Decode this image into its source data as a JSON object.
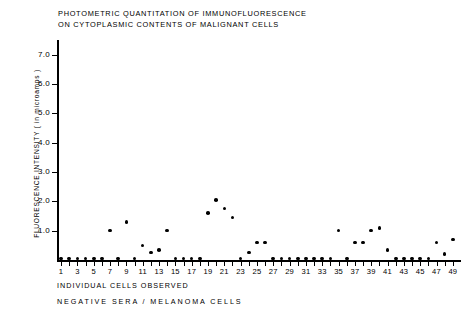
{
  "chart_data": {
    "type": "scatter",
    "title": "PHOTOMETRIC QUANTITATION OF IMMUNOFLUORESCENCE ON CYTOPLASMIC CONTENTS OF MALIGNANT CELLS",
    "title_lines": [
      "PHOTOMETRIC QUANTITATION OF IMMUNOFLUORESCENCE",
      "ON CYTOPLASMIC CONTENTS OF MALIGNANT CELLS"
    ],
    "xlabel": "INDIVIDUAL CELLS OBSERVED",
    "sublabel": "NEGATIVE SERA / MELANOMA CELLS",
    "ylabel": "FLUORESCENCE INTENSITY ( in microamps )",
    "ylim": [
      0,
      7.5
    ],
    "xlim": [
      0.5,
      50
    ],
    "grid": false,
    "legend": null,
    "ytick_labels": [
      "1.0",
      "2.0",
      "3.0",
      "4.0",
      "5.0",
      "6.0",
      "7.0"
    ],
    "yticks": [
      1.0,
      2.0,
      3.0,
      4.0,
      5.0,
      6.0,
      7.0
    ],
    "xtick_labels": [
      "1",
      "3",
      "5",
      "7",
      "9",
      "11",
      "13",
      "15",
      "17",
      "19",
      "21",
      "23",
      "25",
      "27",
      "29",
      "31",
      "33",
      "35",
      "37",
      "39",
      "41",
      "43",
      "45",
      "47",
      "49"
    ],
    "xticks": [
      1,
      3,
      5,
      7,
      9,
      11,
      13,
      15,
      17,
      19,
      21,
      23,
      25,
      27,
      29,
      31,
      33,
      35,
      37,
      39,
      41,
      43,
      45,
      47,
      49
    ],
    "x": [
      1,
      2,
      3,
      4,
      5,
      6,
      7,
      8,
      9,
      10,
      11,
      12,
      13,
      14,
      15,
      16,
      17,
      18,
      19,
      20,
      21,
      22,
      23,
      24,
      25,
      26,
      27,
      28,
      29,
      30,
      31,
      32,
      33,
      34,
      35,
      36,
      37,
      38,
      39,
      40,
      41,
      42,
      43,
      44,
      45,
      46,
      47,
      48,
      49
    ],
    "values": [
      0.05,
      0.05,
      0.05,
      0.05,
      0.05,
      0.05,
      1.0,
      0.05,
      1.3,
      0.05,
      0.5,
      0.25,
      0.35,
      1.0,
      0.05,
      0.05,
      0.05,
      0.05,
      1.6,
      2.05,
      1.75,
      1.45,
      0.05,
      0.25,
      0.6,
      0.6,
      0.05,
      0.05,
      0.05,
      0.05,
      0.05,
      0.05,
      0.05,
      0.05,
      1.0,
      0.05,
      0.6,
      0.6,
      1.0,
      1.1,
      0.35,
      0.05,
      0.05,
      0.05,
      0.05,
      0.05,
      0.6,
      0.2,
      0.7
    ],
    "series_name": "cell fluorescence intensity",
    "marker": "filled-circle",
    "marker_color": "#000000"
  }
}
